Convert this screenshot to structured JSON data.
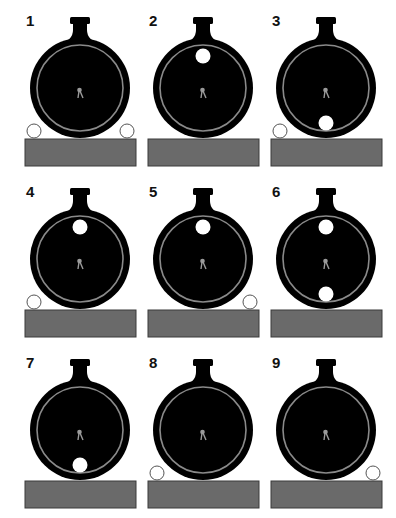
{
  "figure": {
    "colors": {
      "flask": "#000000",
      "ring": "#8a8a8a",
      "needle": "#9a9a9a",
      "block": "#6a6a6a",
      "block_border": "#3a3a3a",
      "ball_inside": "#ffffff",
      "ball_outside_stroke": "#555555"
    },
    "panels": [
      {
        "label": "1",
        "inside": [],
        "outside": [
          "left",
          "right"
        ]
      },
      {
        "label": "2",
        "inside": [
          "top"
        ],
        "outside": []
      },
      {
        "label": "3",
        "inside": [
          "bottom"
        ],
        "outside": [
          "left"
        ]
      },
      {
        "label": "4",
        "inside": [
          "top"
        ],
        "outside": [
          "left"
        ]
      },
      {
        "label": "5",
        "inside": [
          "top"
        ],
        "outside": [
          "right"
        ]
      },
      {
        "label": "6",
        "inside": [
          "top",
          "bottom"
        ],
        "outside": []
      },
      {
        "label": "7",
        "inside": [
          "bottom"
        ],
        "outside": []
      },
      {
        "label": "8",
        "inside": [],
        "outside": [
          "left"
        ]
      },
      {
        "label": "9",
        "inside": [],
        "outside": [
          "right"
        ]
      }
    ]
  }
}
